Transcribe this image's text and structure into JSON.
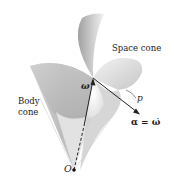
{
  "figure": {
    "type": "diagram",
    "labels": {
      "body_cone_line1": "Body",
      "body_cone_line2": "cone",
      "space_cone": "Space cone",
      "omega": "ω",
      "p": "p",
      "alpha": "α = ω̇",
      "origin": "O"
    },
    "colors": {
      "background": "#ffffff",
      "cone_shade_dark": "#9a9a9a",
      "cone_shade_mid": "#c4c4c4",
      "cone_shade_light": "#ececec",
      "vector": "#222222"
    }
  }
}
